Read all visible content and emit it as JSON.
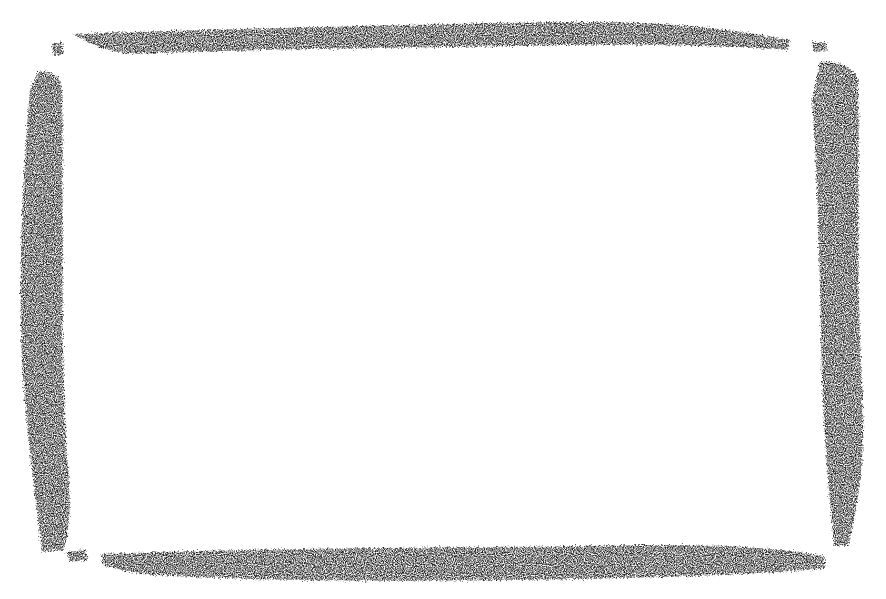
{
  "image": {
    "description": "Hand-drawn charcoal crayon rectangular frame on white background",
    "width": 886,
    "height": 599
  },
  "colors": {
    "background": "#ffffff",
    "stroke": "#1a1a1a"
  },
  "frame": {
    "style": "charcoal-crayon",
    "inner_content": ""
  }
}
